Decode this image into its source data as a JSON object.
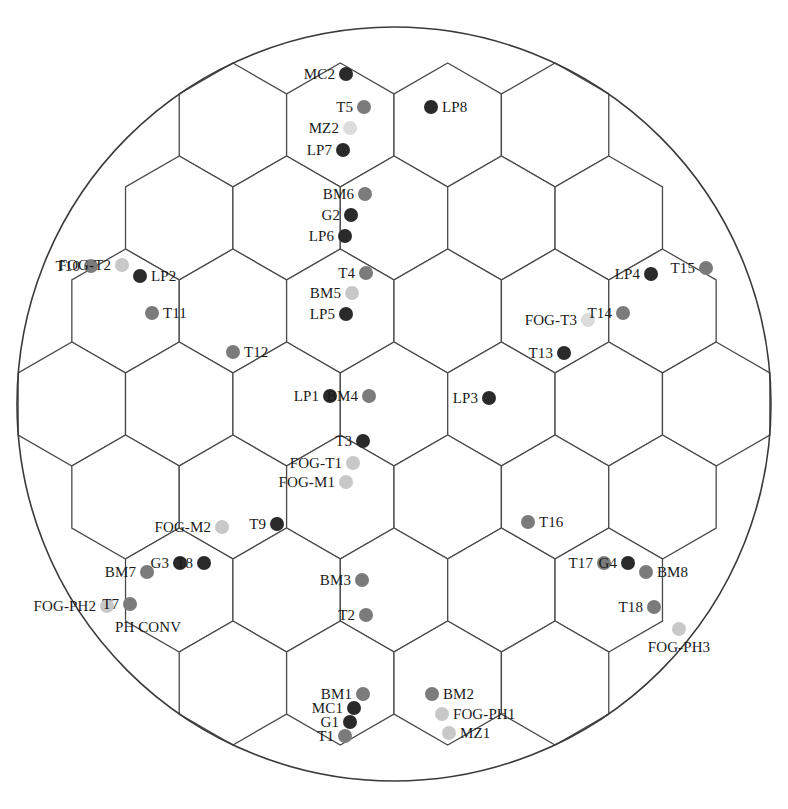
{
  "figure": {
    "type": "hexagonal-grid-layout",
    "boundary": {
      "shape": "circle",
      "cx": 394,
      "cy": 404,
      "r": 377,
      "stroke": "#3a3a3a"
    },
    "hex": {
      "orientation": "pointy-top-row",
      "radius": 62,
      "stroke": "#4a4a4a",
      "fill": "#ffffff"
    },
    "colors": {
      "dark": "#2a2a2a",
      "medium": "#7b7b7b",
      "light": "#c8c8c8",
      "pale": "#dcdcdc",
      "line": "#4a4a4a",
      "text": "#1a1a1a"
    }
  },
  "markers": [
    {
      "label": "MC2",
      "x": 346,
      "y": 74,
      "tone": "dark",
      "side": "left"
    },
    {
      "label": "T5",
      "x": 364,
      "y": 107,
      "tone": "medium",
      "side": "left"
    },
    {
      "label": "LP8",
      "x": 431,
      "y": 107,
      "tone": "dark",
      "side": "right"
    },
    {
      "label": "MZ2",
      "x": 350,
      "y": 128,
      "tone": "pale",
      "side": "left"
    },
    {
      "label": "LP7",
      "x": 343,
      "y": 150,
      "tone": "dark",
      "side": "left"
    },
    {
      "label": "BM6",
      "x": 365,
      "y": 194,
      "tone": "medium",
      "side": "left"
    },
    {
      "label": "G2",
      "x": 351,
      "y": 215,
      "tone": "dark",
      "side": "left"
    },
    {
      "label": "LP6",
      "x": 345,
      "y": 236,
      "tone": "dark",
      "side": "left"
    },
    {
      "label": "FOG-T2",
      "x": 122,
      "y": 265,
      "tone": "light",
      "side": "left"
    },
    {
      "label": "T10",
      "x": 91,
      "y": 266,
      "tone": "medium",
      "side": "left"
    },
    {
      "label": "LP2",
      "x": 140,
      "y": 276,
      "tone": "dark",
      "side": "right"
    },
    {
      "label": "T4",
      "x": 366,
      "y": 273,
      "tone": "medium",
      "side": "left"
    },
    {
      "label": "LP4",
      "x": 651,
      "y": 274,
      "tone": "dark",
      "side": "left"
    },
    {
      "label": "T15",
      "x": 706,
      "y": 268,
      "tone": "medium",
      "side": "left"
    },
    {
      "label": "BM5",
      "x": 352,
      "y": 293,
      "tone": "light",
      "side": "left"
    },
    {
      "label": "T11",
      "x": 152,
      "y": 313,
      "tone": "medium",
      "side": "right"
    },
    {
      "label": "LP5",
      "x": 346,
      "y": 314,
      "tone": "dark",
      "side": "left"
    },
    {
      "label": "T14",
      "x": 623,
      "y": 313,
      "tone": "medium",
      "side": "left"
    },
    {
      "label": "FOG-T3",
      "x": 588,
      "y": 320,
      "tone": "pale",
      "side": "left"
    },
    {
      "label": "T12",
      "x": 233,
      "y": 352,
      "tone": "medium",
      "side": "right"
    },
    {
      "label": "T13",
      "x": 564,
      "y": 353,
      "tone": "dark",
      "side": "left"
    },
    {
      "label": "LP1",
      "x": 330,
      "y": 396,
      "tone": "dark",
      "side": "left"
    },
    {
      "label": "BM4",
      "x": 369,
      "y": 396,
      "tone": "medium",
      "side": "left"
    },
    {
      "label": "LP3",
      "x": 489,
      "y": 398,
      "tone": "dark",
      "side": "left"
    },
    {
      "label": "T3",
      "x": 363,
      "y": 441,
      "tone": "dark",
      "side": "left"
    },
    {
      "label": "FOG-T1",
      "x": 353,
      "y": 463,
      "tone": "light",
      "side": "left"
    },
    {
      "label": "FOG-M1",
      "x": 346,
      "y": 482,
      "tone": "light",
      "side": "left"
    },
    {
      "label": "FOG-M2",
      "x": 222,
      "y": 527,
      "tone": "light",
      "side": "left"
    },
    {
      "label": "T9",
      "x": 277,
      "y": 524,
      "tone": "dark",
      "side": "left"
    },
    {
      "label": "T16",
      "x": 528,
      "y": 522,
      "tone": "medium",
      "side": "right"
    },
    {
      "label": "G3",
      "x": 180,
      "y": 563,
      "tone": "dark",
      "side": "left"
    },
    {
      "label": "T8",
      "x": 204,
      "y": 563,
      "tone": "dark",
      "side": "left"
    },
    {
      "label": "T17",
      "x": 604,
      "y": 563,
      "tone": "medium",
      "side": "left"
    },
    {
      "label": "G4",
      "x": 628,
      "y": 563,
      "tone": "dark",
      "side": "left"
    },
    {
      "label": "BM7",
      "x": 147,
      "y": 572,
      "tone": "medium",
      "side": "left"
    },
    {
      "label": "BM8",
      "x": 646,
      "y": 572,
      "tone": "medium",
      "side": "right"
    },
    {
      "label": "BM3",
      "x": 362,
      "y": 580,
      "tone": "medium",
      "side": "left"
    },
    {
      "label": "FOG-PH2",
      "x": 107,
      "y": 606,
      "tone": "light",
      "side": "left"
    },
    {
      "label": "T7",
      "x": 130,
      "y": 604,
      "tone": "medium",
      "side": "left"
    },
    {
      "label": "T18",
      "x": 654,
      "y": 607,
      "tone": "medium",
      "side": "left"
    },
    {
      "label": "T2",
      "x": 366,
      "y": 615,
      "tone": "medium",
      "side": "left"
    },
    {
      "label": "PH CONV",
      "x": 107,
      "y": 627,
      "tone": "light",
      "side": "labelonly-left"
    },
    {
      "label": "FOG-PH3",
      "x": 679,
      "y": 629,
      "tone": "light",
      "side": "below"
    },
    {
      "label": "BM1",
      "x": 363,
      "y": 694,
      "tone": "medium",
      "side": "left"
    },
    {
      "label": "BM2",
      "x": 432,
      "y": 694,
      "tone": "medium",
      "side": "right"
    },
    {
      "label": "MC1",
      "x": 354,
      "y": 708,
      "tone": "dark",
      "side": "left"
    },
    {
      "label": "FOG-PH1",
      "x": 442,
      "y": 714,
      "tone": "light",
      "side": "right"
    },
    {
      "label": "G1",
      "x": 350,
      "y": 722,
      "tone": "dark",
      "side": "left"
    },
    {
      "label": "T1",
      "x": 345,
      "y": 736,
      "tone": "medium",
      "side": "left"
    },
    {
      "label": "MZ1",
      "x": 449,
      "y": 733,
      "tone": "light",
      "side": "right"
    }
  ]
}
